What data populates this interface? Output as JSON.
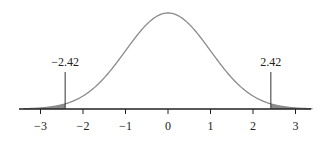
{
  "chart_data": {
    "type": "area",
    "title": "",
    "xlabel": "",
    "ylabel": "",
    "distribution": "standard normal density",
    "xlim": [
      -3.4,
      3.4
    ],
    "x_ticks": [
      -3,
      -2,
      -1,
      0,
      1,
      2,
      3
    ],
    "x_tick_labels": [
      "−3",
      "−2",
      "−1",
      "0",
      "1",
      "2",
      "3"
    ],
    "grid": false,
    "legend": null,
    "critical_values": [
      -2.42,
      2.42
    ],
    "annotations": [
      {
        "x": -2.42,
        "label": "−2.42"
      },
      {
        "x": 2.42,
        "label": "2.42"
      }
    ],
    "shaded_regions": [
      {
        "from": -3.4,
        "to": -2.42,
        "description": "left tail"
      },
      {
        "from": 2.42,
        "to": 3.4,
        "description": "right tail"
      }
    ],
    "colors": {
      "curve": "#8a8a8a",
      "shade": "#8c8c8c",
      "axis": "#222222",
      "marker": "#333333"
    }
  }
}
